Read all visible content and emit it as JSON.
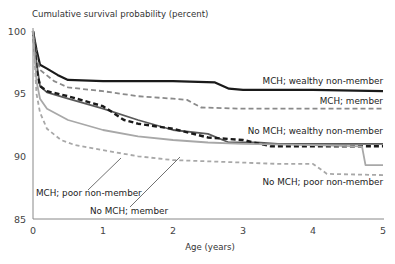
{
  "chart_data": {
    "type": "line",
    "title": "",
    "ylabel": "Cumulative survival probability (percent)",
    "xlabel": "Age (years)",
    "xlim": [
      0,
      5
    ],
    "ylim": [
      85,
      100
    ],
    "x_ticks": [
      "0",
      "1",
      "2",
      "3",
      "4",
      "5"
    ],
    "y_ticks": [
      "85",
      "90",
      "95",
      "100"
    ],
    "grid": false,
    "legend_position": "inline labels",
    "series": [
      {
        "name": "MCH; wealthy non-member",
        "style": "solid-black",
        "x": [
          0,
          0.05,
          0.1,
          0.2,
          0.35,
          0.5,
          1.0,
          2.0,
          2.6,
          2.8,
          3.0,
          4.0,
          5.0
        ],
        "values": [
          100,
          98.5,
          97.3,
          97.0,
          96.5,
          96.1,
          96.0,
          96.0,
          95.9,
          95.4,
          95.3,
          95.3,
          95.2
        ]
      },
      {
        "name": "MCH; member",
        "style": "dashed-gray",
        "x": [
          0,
          0.05,
          0.1,
          0.3,
          0.5,
          1.0,
          1.5,
          2.0,
          2.2,
          2.4,
          3.0,
          4.0,
          5.0
        ],
        "values": [
          100,
          98.0,
          96.9,
          96.0,
          95.5,
          95.2,
          94.8,
          94.6,
          94.5,
          93.9,
          93.8,
          93.8,
          93.8
        ]
      },
      {
        "name": "No MCH; wealthy non-member",
        "style": "solid-darkgray",
        "x": [
          0,
          0.05,
          0.1,
          0.2,
          0.5,
          1.0,
          1.5,
          2.0,
          2.5,
          2.8,
          3.2,
          3.5,
          4.0,
          5.0
        ],
        "values": [
          100,
          97.5,
          95.6,
          95.1,
          94.6,
          93.8,
          92.9,
          92.1,
          91.8,
          91.1,
          91.1,
          91.0,
          91.0,
          91.0
        ]
      },
      {
        "name": "MCH; poor non-member",
        "style": "dashed-black-thick",
        "x": [
          0,
          0.05,
          0.1,
          0.2,
          0.5,
          1.0,
          1.3,
          1.5,
          2.0,
          2.5,
          3.0,
          3.4,
          4.0,
          5.0
        ],
        "values": [
          100,
          97.0,
          95.6,
          95.2,
          94.8,
          94.0,
          92.9,
          92.6,
          92.2,
          91.5,
          91.3,
          90.8,
          90.8,
          90.8
        ]
      },
      {
        "name": "No MCH; member",
        "style": "solid-lightgray",
        "x": [
          0,
          0.05,
          0.1,
          0.2,
          0.5,
          1.0,
          1.5,
          2.0,
          2.5,
          3.0,
          4.0,
          4.7,
          4.75,
          5.0
        ],
        "values": [
          100,
          96.0,
          94.6,
          93.8,
          92.9,
          92.1,
          91.6,
          91.3,
          91.1,
          91.0,
          90.9,
          90.8,
          89.3,
          89.3
        ]
      },
      {
        "name": "No MCH; poor non-member",
        "style": "dashed-lightgray",
        "x": [
          0,
          0.05,
          0.1,
          0.2,
          0.4,
          0.6,
          1.0,
          1.5,
          2.0,
          2.5,
          3.0,
          3.5,
          4.0,
          4.2,
          5.0
        ],
        "values": [
          100,
          95.0,
          93.5,
          92.2,
          91.3,
          90.9,
          90.5,
          90.0,
          89.7,
          89.6,
          89.5,
          89.4,
          89.4,
          88.6,
          88.5
        ]
      }
    ],
    "annotations": [
      {
        "text": "MCH; wealthy non-member",
        "points_to": "MCH; wealthy non-member"
      },
      {
        "text": "MCH; member",
        "points_to": "MCH; member"
      },
      {
        "text": "No MCH; wealthy non-member",
        "points_to": "No MCH; wealthy non-member"
      },
      {
        "text": "MCH; poor non-member",
        "points_to": "No MCH; wealthy non-member (leader line)"
      },
      {
        "text": "No MCH; member",
        "points_to": "No MCH; member (leader line)"
      },
      {
        "text": "No MCH; poor non-member",
        "points_to": "No MCH; poor non-member"
      }
    ]
  },
  "labels": {
    "ylabel": "Cumulative survival probability (percent)",
    "xlabel": "Age (years)",
    "series": {
      "mch_wealthy": "MCH; wealthy non-member",
      "mch_member": "MCH; member",
      "nomch_wealthy": "No MCH; wealthy non-member",
      "mch_poor": "MCH; poor non-member",
      "nomch_member": "No MCH; member",
      "nomch_poor": "No MCH; poor non-member"
    }
  },
  "colors": {
    "black": "#1a1a1a",
    "darkgray": "#5a5a5a",
    "midgray": "#8a8a8a",
    "lightgray": "#a8a8a8",
    "axis": "#888888"
  }
}
